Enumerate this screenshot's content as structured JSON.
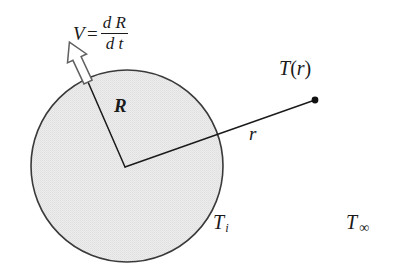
{
  "figure": {
    "background_color": "#ffffff",
    "width": 394,
    "height": 269
  },
  "sphere": {
    "name": "shaded-circle",
    "center_x": 127,
    "center_y": 166,
    "radius": 96,
    "fill_color": "#e9e9e9",
    "stroke_color": "#3a3a3a",
    "stroke_width": 1.6
  },
  "labels": {
    "velocity": {
      "lhs": "V",
      "equals": "=",
      "numerator": "d R",
      "denominator": "d t",
      "full_text": "V = dR/dt"
    },
    "radius": "R",
    "distance": "r",
    "temperature_at_r": {
      "symbol": "T",
      "open_paren": "(",
      "argument": "r",
      "close_paren": ")",
      "full_text": "T(r)"
    },
    "initial_temperature": {
      "symbol": "T",
      "subscript": "i",
      "full_text": "T_i"
    },
    "ambient_temperature": {
      "symbol": "T",
      "subscript": "∞",
      "full_text": "T_∞"
    }
  },
  "geometry": {
    "radius_line": {
      "name": "radius-line-R",
      "from_x": 125,
      "from_y": 167,
      "to_x": 88,
      "to_y": 82,
      "stroke_color": "#1a1a1a"
    },
    "ray_line": {
      "name": "radial-distance-line-r",
      "from_x": 125,
      "from_y": 167,
      "to_x": 315,
      "to_y": 100,
      "stroke_color": "#1a1a1a"
    },
    "field_point": {
      "name": "field-point-dot",
      "x": 315,
      "y": 100,
      "radius": 3.4,
      "color": "#111111"
    },
    "velocity_arrow": {
      "name": "velocity-arrow",
      "tail_x": 88,
      "tail_y": 82,
      "tip_x": 68,
      "tip_y": 40,
      "fill_color": "#ffffff",
      "stroke_color": "#555555"
    }
  }
}
